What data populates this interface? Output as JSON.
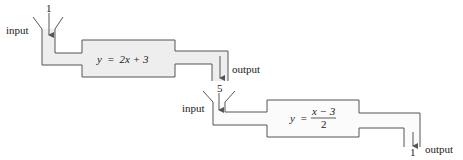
{
  "colors": {
    "line": "#555555",
    "machine1_fill": "#eeeeee",
    "machine2_fill": "#fbfbfb",
    "text": "#222222"
  },
  "machine1": {
    "input_label": "input",
    "input_value": "1",
    "function": {
      "lhs": "y",
      "eq": "=",
      "rhs": "2x + 3"
    },
    "output_label": "output",
    "output_value": "5"
  },
  "machine2": {
    "input_label": "input",
    "function": {
      "lhs": "y",
      "eq": "=",
      "numerator": "x − 3",
      "denominator": "2"
    },
    "output_label": "output",
    "output_value": "1"
  }
}
